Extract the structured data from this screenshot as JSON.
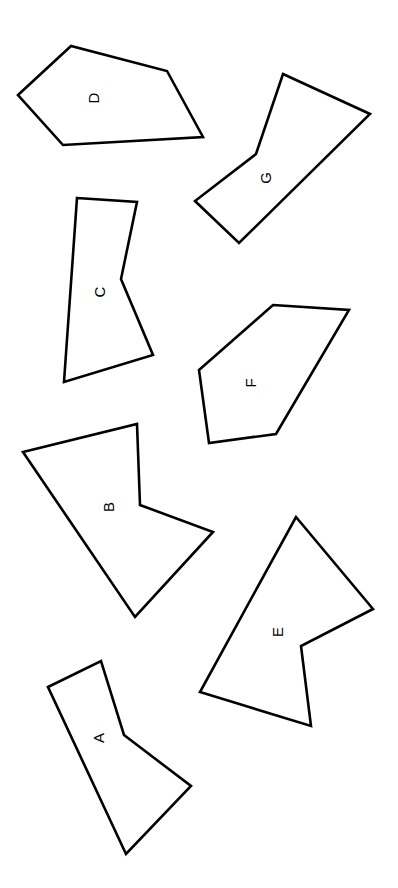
{
  "figure": {
    "background": "#ffffff",
    "stroke_color": "#000000",
    "label_rotation_deg": -90
  },
  "shapes": [
    {
      "label": "D",
      "points": "18,95 71,46 167,71 203,137 63,145",
      "label_pos": [
        93,
        98
      ]
    },
    {
      "label": "G",
      "points": "283,74 370,114 239,243 195,201 256,154",
      "label_pos": [
        265,
        178
      ]
    },
    {
      "label": "C",
      "points": "77,198 137,202 121,279 153,355 64,382",
      "label_pos": [
        99,
        292
      ]
    },
    {
      "label": "F",
      "points": "273,305 349,310 276,434 209,443 199,370",
      "label_pos": [
        250,
        383
      ]
    },
    {
      "label": "B",
      "points": "23,452 137,424 140,505 213,532 135,617",
      "label_pos": [
        108,
        507
      ]
    },
    {
      "label": "E",
      "points": "296,517 373,609 301,646 311,726 200,692",
      "label_pos": [
        277,
        632
      ]
    },
    {
      "label": "A",
      "points": "48,687 101,661 124,735 191,786 126,854",
      "label_pos": [
        98,
        738
      ]
    }
  ]
}
